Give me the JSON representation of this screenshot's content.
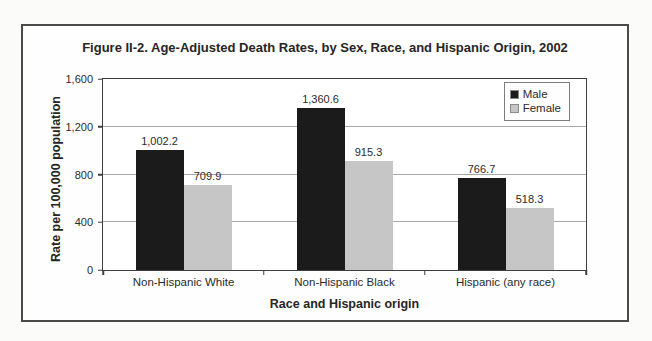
{
  "figure": {
    "title": "Figure II-2. Age-Adjusted Death Rates, by Sex, Race, and Hispanic Origin, 2002"
  },
  "chart_data": {
    "type": "bar",
    "title": "Figure II-2. Age-Adjusted Death Rates, by Sex, Race, and Hispanic Origin, 2002",
    "categories": [
      "Non-Hispanic White",
      "Non-Hispanic Black",
      "Hispanic (any race)"
    ],
    "series": [
      {
        "name": "Male",
        "color": "#1b1b1b",
        "values": [
          1002.2,
          1360.6,
          766.7
        ],
        "labels": [
          "1,002.2",
          "1,360.6",
          "766.7"
        ]
      },
      {
        "name": "Female",
        "color": "#c6c6c6",
        "values": [
          709.9,
          915.3,
          518.3
        ],
        "labels": [
          "709.9",
          "915.3",
          "518.3"
        ]
      }
    ],
    "xlabel": "Race and Hispanic origin",
    "ylabel": "Rate per 100,000 population",
    "ylim": [
      0,
      1600
    ],
    "yticks": [
      {
        "value": 0,
        "label": "0"
      },
      {
        "value": 400,
        "label": "400"
      },
      {
        "value": 800,
        "label": "800"
      },
      {
        "value": 1200,
        "label": "1,200"
      },
      {
        "value": 1600,
        "label": "1,600"
      }
    ],
    "gridlines": [
      400,
      800,
      1200
    ],
    "grid": "horizontal",
    "legend": {
      "position": "top-right",
      "entries": [
        "Male",
        "Female"
      ]
    }
  }
}
